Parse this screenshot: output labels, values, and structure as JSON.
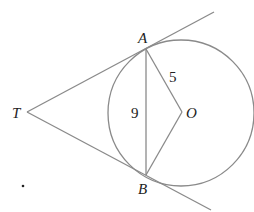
{
  "diagram": {
    "type": "geometry",
    "points": {
      "T": {
        "label": "T",
        "x": 27,
        "y": 112
      },
      "A": {
        "label": "A",
        "x": 146,
        "y": 49
      },
      "B": {
        "label": "B",
        "x": 146,
        "y": 175
      },
      "O": {
        "label": "O",
        "x": 181,
        "y": 112
      }
    },
    "circle": {
      "center": "O",
      "cx": 181,
      "cy": 113,
      "r": 73
    },
    "segment_labels": {
      "AO": "5",
      "AB": "9"
    },
    "stroke_color": "#8a8a8a",
    "dot": {
      "x": 23,
      "y": 186
    }
  }
}
